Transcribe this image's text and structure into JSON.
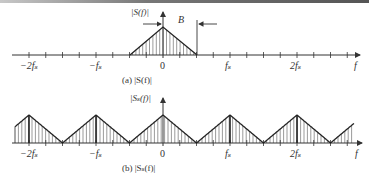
{
  "figure": {
    "panel_a": {
      "caption": "(a) |S(f)|",
      "y_label": "|S(f)|",
      "bandwidth_label": "B",
      "x_axis_label": "f",
      "tick_labels": [
        "−2fₛ",
        "−fₛ",
        "0",
        "fₛ",
        "2fₛ"
      ]
    },
    "panel_b": {
      "caption": "(b) |Sₛ(f)|",
      "y_label": "|Sₛ(f)|",
      "x_axis_label": "f",
      "tick_labels": [
        "−2fₛ",
        "−fₛ",
        "0",
        "fₛ",
        "2fₛ"
      ]
    }
  }
}
